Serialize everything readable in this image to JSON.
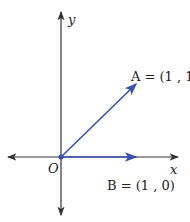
{
  "diagram": {
    "axes": {
      "x_label": "x",
      "y_label": "y",
      "origin_label": "O"
    },
    "vectors": [
      {
        "name": "A",
        "label": "A = (1 , 1)",
        "coords": [
          1,
          1
        ]
      },
      {
        "name": "B",
        "label": "B = (1 , 0)",
        "coords": [
          1,
          0
        ]
      }
    ],
    "colors": {
      "axis": "#333333",
      "vector": "#3a4fb0"
    }
  }
}
